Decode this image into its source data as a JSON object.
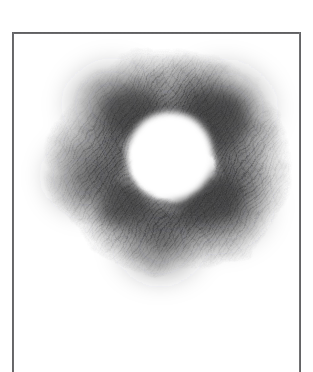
{
  "artwork": {
    "title": "Graphite Ring Study",
    "medium": "pencil on paper",
    "subject": "shaded annulus with blank circular center",
    "caption": "",
    "background_color": "#ffffff",
    "paper_color": "#ffffff",
    "graphite_color": "#3a3a3c",
    "frame_color": "#5a5a5c"
  },
  "frame": {
    "name": "drawn-border",
    "left_x": 12,
    "top_y": 32,
    "right_x": 301,
    "stroke_width": 2,
    "open_at_bottom": true,
    "color": "#5a5a5c"
  },
  "drawing": {
    "type": "annulus",
    "center_x": 170,
    "center_y": 156,
    "hole_radius": 42,
    "outer_radius": 120,
    "hole_color": "#ffffff",
    "darkest_value": "#3a3a3c",
    "lightest_value": "#ffffff",
    "hatch_angle_degrees": 35,
    "lobes": [
      {
        "name": "upper-right-lobe",
        "cx": 224,
        "cy": 108,
        "darkness": 0.92
      },
      {
        "name": "lower-right-lobe",
        "cx": 222,
        "cy": 206,
        "darkness": 0.84
      },
      {
        "name": "upper-left-lobe",
        "cx": 112,
        "cy": 104,
        "darkness": 0.78
      },
      {
        "name": "left-lobe",
        "cx": 84,
        "cy": 176,
        "darkness": 0.7
      },
      {
        "name": "lower-tail-lobe",
        "cx": 160,
        "cy": 246,
        "darkness": 0.76
      }
    ],
    "extent": {
      "left_x": 44,
      "top_y": 56,
      "right_x": 288,
      "bottom_y": 284
    }
  }
}
